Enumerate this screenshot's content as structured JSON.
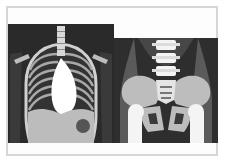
{
  "figure": {
    "panels": [
      {
        "id": "chest",
        "label": "Chest X-ray illustration",
        "colors": {
          "background": "#2a2a2a",
          "ribs": "#bdbdbd",
          "heart": "#ffffff",
          "abdomen": "#bcbcbc",
          "stomach_bubble": "#555555"
        }
      },
      {
        "id": "pelvis",
        "label": "Pelvis X-ray illustration",
        "colors": {
          "background": "#2e2e2e",
          "soft_tissue": "#5a5a5a",
          "bone": "#bdbdbd",
          "bright_bone": "#f4f4f4"
        }
      }
    ],
    "border_color": "#d6d6d6"
  }
}
